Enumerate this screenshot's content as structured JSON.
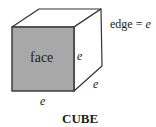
{
  "diagram": {
    "title": "CUBE",
    "face_label": "face",
    "edge_definition": {
      "text": "edge = ",
      "variable": "e"
    },
    "edge_labels": {
      "front_right": "e",
      "depth_bottom_right": "e",
      "front_bottom": "e"
    },
    "colors": {
      "face_fill": "#a8a8a8",
      "stroke": "#333333",
      "background": "#ffffff"
    }
  }
}
